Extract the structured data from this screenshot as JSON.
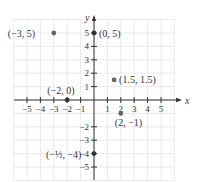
{
  "chart_data": {
    "type": "scatter",
    "title": "",
    "xlabel": "x",
    "ylabel": "y",
    "xlim": [
      -5,
      5
    ],
    "ylim": [
      -5,
      5
    ],
    "grid": true,
    "x_ticks": [
      -5,
      -4,
      -3,
      -2,
      -1,
      1,
      2,
      3,
      4,
      5
    ],
    "y_ticks": [
      5,
      4,
      3,
      2,
      1,
      -2,
      -3,
      -4,
      -5
    ],
    "x_tick_labels": [
      "−5",
      "−4",
      "−3",
      "−2",
      "−1",
      "1",
      "2",
      "3",
      "4",
      "5"
    ],
    "y_tick_labels": [
      "5",
      "4",
      "3",
      "2",
      "1",
      "−2",
      "−3",
      "−4",
      "−5"
    ],
    "points": [
      {
        "x": -3,
        "y": 5,
        "label": "(−3, 5)"
      },
      {
        "x": 0,
        "y": 5,
        "label": "(0, 5)"
      },
      {
        "x": 1.5,
        "y": 1.5,
        "label": "(1.5, 1.5)"
      },
      {
        "x": -2,
        "y": 0,
        "label": "(−2, 0)"
      },
      {
        "x": 2,
        "y": -1,
        "label": "(2, −1)"
      },
      {
        "x": -0.5,
        "y": -4,
        "label": "(−½, −4)"
      }
    ],
    "colors": {
      "axis": "#333333",
      "grid": "#e4e4e4",
      "point": "#666666",
      "point_on_axis": "#333333"
    }
  }
}
